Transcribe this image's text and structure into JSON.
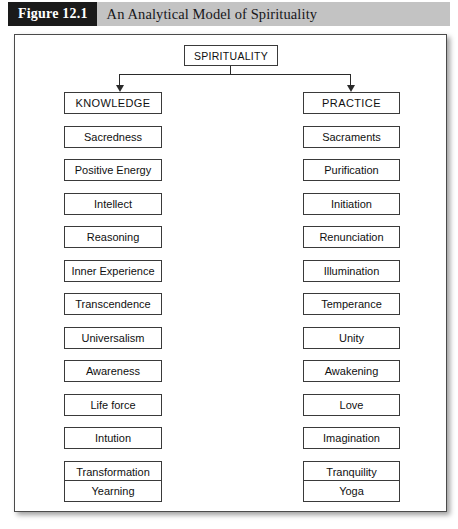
{
  "header": {
    "figure_number": "Figure 12.1",
    "title": "An Analytical Model of Spirituality"
  },
  "diagram": {
    "root": {
      "label": "SPIRITUALITY"
    },
    "branches": [
      {
        "head": "KNOWLEDGE",
        "items": [
          "Sacredness",
          "Positive Energy",
          "Intellect",
          "Reasoning",
          "Inner Experience",
          "Transcendence",
          "Universalism",
          "Awareness",
          "Life force",
          "Intution",
          "Transformation",
          "Yearning"
        ]
      },
      {
        "head": "PRACTICE",
        "items": [
          "Sacraments",
          "Purification",
          "Initiation",
          "Renunciation",
          "Illumination",
          "Temperance",
          "Unity",
          "Awakening",
          "Love",
          "Imagination",
          "Tranquility",
          "Yoga"
        ]
      }
    ]
  },
  "colors": {
    "banner_background": "#c3c3c3",
    "figure_number_background": "#1a1a1a",
    "box_border": "#3a3a3a",
    "frame_border": "#4b4b4b",
    "page_background": "#ffffff"
  }
}
